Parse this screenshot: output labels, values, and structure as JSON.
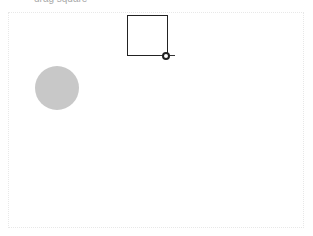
{
  "header": {
    "partial_text": "drag square"
  },
  "canvas": {
    "square": {
      "x": 127,
      "y": 15,
      "size": 41,
      "border": "#222222"
    },
    "resize_handle": {
      "x": 166,
      "y": 56
    },
    "circle": {
      "cx": 57,
      "cy": 88,
      "r": 22,
      "color": "#c8c8c8"
    }
  }
}
